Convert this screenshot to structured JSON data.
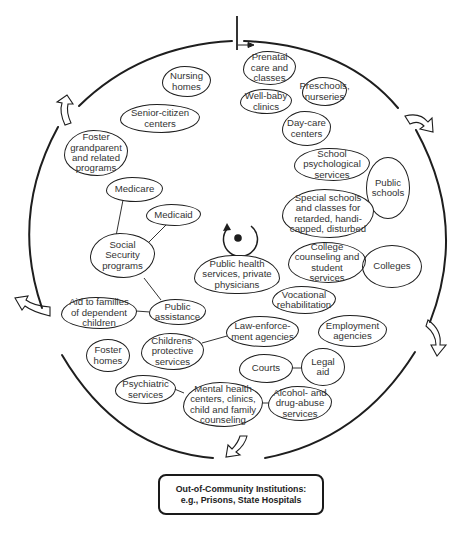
{
  "diagram": {
    "type": "cycle-of-community-services",
    "center": {
      "icon": "rotation-arrow-around-dot-icon",
      "label": "Public health\nservices, private\nphysicians"
    },
    "nodes": {
      "prenatal": "Prenatal\ncare and\nclasses",
      "preschools": "Preschools,\nnurseries",
      "well_baby": "Well-baby\nclinics",
      "day_care": "Day-care\ncenters",
      "school_psych": "School\npsychological\nservices",
      "public_schools": "Public\nschools",
      "special_schools": "Special schools\nand classes for\nretarded, handi-\ncapped, disturbed",
      "college_counseling": "College\ncounseling and\nstudent\nservices",
      "colleges": "Colleges",
      "vocational": "Vocational\nrehabilitation",
      "employment": "Employment\nagencies",
      "law_enforcement": "Law-enforce-\nment agencies",
      "courts": "Courts",
      "legal_aid": "Legal\naid",
      "alcohol": "Alcohol- and\ndrug-abuse\nservices",
      "mental_health": "Mental health\ncenters, clinics,\nchild and family\ncounseling",
      "psychiatric": "Psychiatric\nservices",
      "childrens_protective": "Childrens'\nprotective\nservices",
      "foster_homes": "Foster\nhomes",
      "aid_families": "Aid to families\nof dependent\nchildren",
      "public_assistance": "Public\nassistance",
      "social_security": "Social\nSecurity\nprograms",
      "medicare": "Medicare",
      "medicaid": "Medicaid",
      "foster_grandparent": "Foster\ngrandparent\nand related\nprograms",
      "senior_citizen": "Senior-citizen\ncenters",
      "nursing_homes": "Nursing\nhomes"
    },
    "connections": [
      [
        "medicare",
        "social_security"
      ],
      [
        "medicaid",
        "social_security"
      ],
      [
        "social_security",
        "public_assistance"
      ],
      [
        "aid_families",
        "public_assistance"
      ],
      [
        "childrens_protective",
        "law_enforcement"
      ],
      [
        "courts",
        "legal_aid"
      ],
      [
        "psychiatric",
        "mental_health"
      ],
      [
        "mental_health",
        "alcohol"
      ]
    ],
    "out_of_community": {
      "line1": "Out-of-Community Institutions:",
      "line2": "e.g., Prisons, State Hospitals"
    },
    "colors": {
      "stroke": "#1e1e1e",
      "text": "#333333",
      "background": "#ffffff"
    }
  }
}
